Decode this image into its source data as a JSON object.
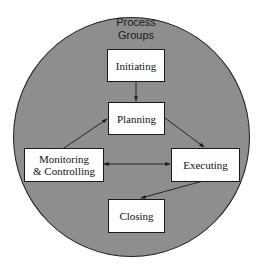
{
  "diagram": {
    "title_line1": "Process",
    "title_line2": "Groups",
    "colors": {
      "circle_fill": "#8e8e8e",
      "circle_stroke": "#1e1e1e",
      "box_fill": "#ffffff",
      "box_stroke": "#1a1a1a",
      "arrow": "#1a1a1a"
    },
    "nodes": [
      {
        "id": "initiating",
        "label": "Initiating"
      },
      {
        "id": "planning",
        "label": "Planning"
      },
      {
        "id": "monitoring",
        "label_line1": "Monitoring",
        "label_line2": "& Controlling"
      },
      {
        "id": "executing",
        "label": "Executing"
      },
      {
        "id": "closing",
        "label": "Closing"
      }
    ],
    "edges": [
      {
        "from": "Initiating",
        "to": "Planning",
        "direction": "one-way"
      },
      {
        "from": "Monitoring & Controlling",
        "to": "Planning",
        "direction": "one-way"
      },
      {
        "from": "Planning",
        "to": "Executing",
        "direction": "one-way"
      },
      {
        "from": "Executing",
        "to": "Closing",
        "direction": "one-way"
      },
      {
        "from": "Monitoring & Controlling",
        "to": "Executing",
        "direction": "bidirectional"
      }
    ]
  }
}
